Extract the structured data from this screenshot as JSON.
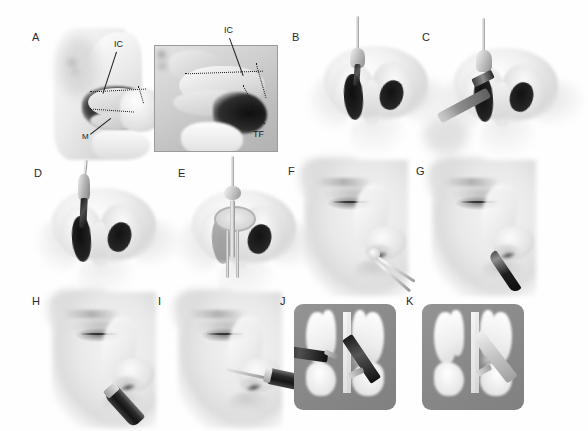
{
  "figure": {
    "background_color": "#ffffff",
    "panel_count": 11,
    "style": "grayscale medical airbrush illustration",
    "rows": 3,
    "coronal_panel_bg": "#8a8a8a"
  },
  "panels": [
    {
      "id": "A",
      "label": "A",
      "row": 1,
      "view": "sagittal cut-away of lateral nasal wall with magnified inset",
      "annotations": [
        {
          "text": "IC",
          "meaning": "inferior concha"
        },
        {
          "text": "M",
          "meaning": "mucosa incision line"
        }
      ]
    },
    {
      "id": "A-inset",
      "label": "",
      "row": 1,
      "view": "magnified inset of inferior turbinate",
      "annotations": [
        {
          "text": "IC",
          "meaning": "inferior concha"
        },
        {
          "text": "TF",
          "meaning": "turbinate flap"
        }
      ]
    },
    {
      "id": "B",
      "label": "B",
      "row": 1,
      "view": "nasal base view with elevator introduced into left naris",
      "annotations": []
    },
    {
      "id": "C",
      "label": "C",
      "row": 1,
      "view": "nasal base view with endoscope and instrument in left naris",
      "annotations": []
    },
    {
      "id": "D",
      "label": "D",
      "row": 2,
      "view": "nasal base view with scissors in left naris",
      "annotations": []
    },
    {
      "id": "E",
      "label": "E",
      "row": 2,
      "view": "nasal base view with nasal speculum opened in left naris",
      "annotations": []
    },
    {
      "id": "F",
      "label": "F",
      "row": 2,
      "view": "lateral facial profile with scissors entering nostril",
      "annotations": []
    },
    {
      "id": "G",
      "label": "G",
      "row": 2,
      "view": "lateral facial profile with dark blade instrument entering nostril",
      "annotations": []
    },
    {
      "id": "H",
      "label": "H",
      "row": 3,
      "view": "lateral facial profile with powered handpiece at nostril",
      "annotations": []
    },
    {
      "id": "I",
      "label": "I",
      "row": 3,
      "view": "lateral facial profile with long microdebrider probe inserted",
      "annotations": []
    },
    {
      "id": "J",
      "label": "J",
      "row": 3,
      "view": "endoscopic coronal view of nasal cavity with two instruments at inferior turbinates",
      "annotations": []
    },
    {
      "id": "K",
      "label": "K",
      "row": 3,
      "view": "endoscopic coronal view of nasal cavity with single instrument at right inferior turbinate",
      "annotations": []
    }
  ],
  "labels": {
    "ic": "IC",
    "tf": "TF",
    "m": "M",
    "a": "A",
    "b": "B",
    "c": "C",
    "d": "D",
    "e": "E",
    "f": "F",
    "g": "G",
    "h": "H",
    "i": "I",
    "j": "J",
    "k": "K"
  }
}
